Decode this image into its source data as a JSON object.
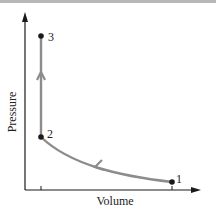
{
  "diagram": {
    "type": "pv-diagram",
    "xlabel": "Volume",
    "ylabel": "Pressure",
    "points": [
      {
        "label": "1",
        "x": 172,
        "y": 182
      },
      {
        "label": "2",
        "x": 41,
        "y": 137
      },
      {
        "label": "3",
        "x": 41,
        "y": 36
      }
    ],
    "processes": [
      {
        "from": "1",
        "to": "2",
        "shape": "curve",
        "direction": "toward 2"
      },
      {
        "from": "2",
        "to": "3",
        "shape": "vertical line",
        "direction": "upward"
      }
    ],
    "colors": {
      "axis": "#1a1a1a",
      "path": "#8c8c8c",
      "point": "#1a1a1a",
      "top_border": "#b8b8b8"
    }
  }
}
